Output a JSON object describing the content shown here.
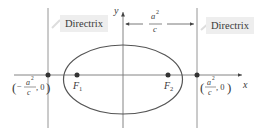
{
  "diagram": {
    "type": "ellipse-directrix",
    "axes": {
      "x_label": "x",
      "y_label": "y"
    },
    "directrix_labels": {
      "left": "Directrix",
      "right": "Directrix"
    },
    "distance_label": {
      "numerator": "a",
      "exponent": "2",
      "denominator": "c"
    },
    "foci": {
      "f1": {
        "letter": "F",
        "sub": "1"
      },
      "f2": {
        "letter": "F",
        "sub": "2"
      }
    },
    "points": {
      "left": {
        "open": "(",
        "sign": "−",
        "numerator": "a",
        "exponent": "2",
        "denominator": "c",
        "rest": ", 0",
        "close": ")"
      },
      "right": {
        "open": "(",
        "numerator": "a",
        "exponent": "2",
        "denominator": "c",
        "rest": ", 0",
        "close": ")"
      }
    },
    "colors": {
      "line": "#8a8a8a",
      "ellipse": "#555555",
      "point": "#333333",
      "label_bg": "#eeeeee"
    }
  }
}
